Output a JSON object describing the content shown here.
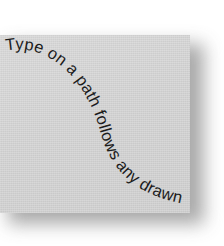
{
  "canvas": {
    "width": 224,
    "height": 246,
    "background_color": "#ffffff"
  },
  "artwork_panel": {
    "name": "type-on-a-path-sample",
    "fill_color": "#d3d3d3",
    "shadow_color": "#9a9a9a",
    "x": 0,
    "y": 35,
    "width": 190,
    "height": 178
  },
  "path_text": {
    "content": "Type on a path follows any drawn line",
    "words": [
      "Type",
      "on",
      "a",
      "path",
      "follows",
      "any",
      "drawn",
      "line"
    ],
    "text_color": "#1c1c1c",
    "font_size_px": 16.5,
    "path_shape": "s-curve",
    "path_description": "Starts upper-left flowing rightward, curves steeply downward through the center, then flattens toward the lower-right",
    "start_point": {
      "x": 6,
      "y": 18
    },
    "end_point": {
      "x": 178,
      "y": 163
    }
  }
}
